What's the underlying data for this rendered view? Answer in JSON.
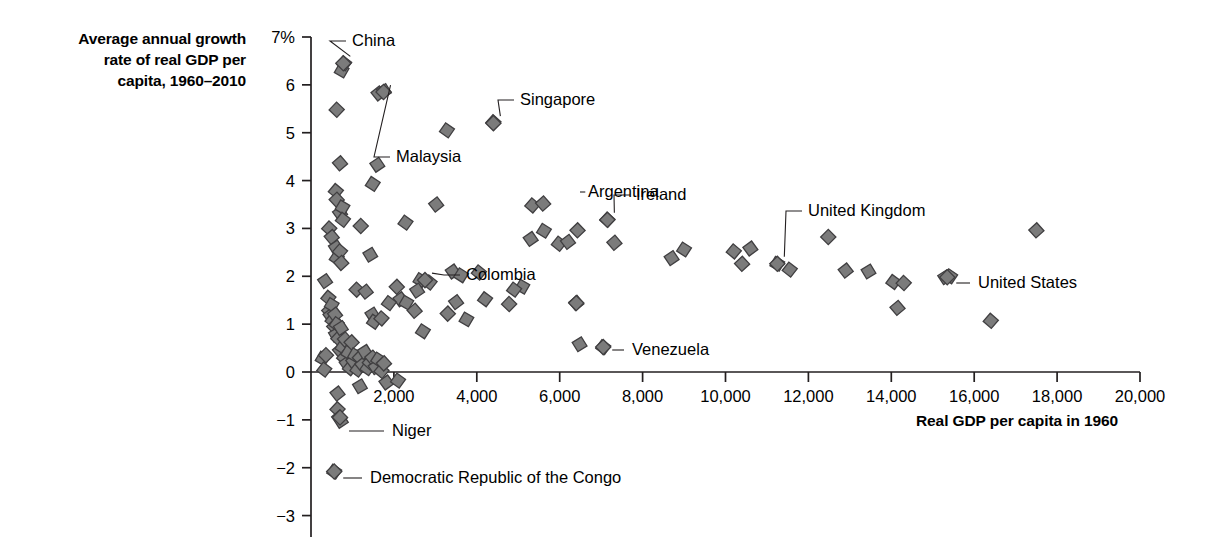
{
  "axis_title_y": "Average annual growth rate of real GDP per capita, 1960–2010",
  "axis_title_y_lines": [
    "Average annual growth",
    "rate of real GDP per",
    "capita, 1960–2010"
  ],
  "axis_title_x": "Real GDP per capita in 1960",
  "colors": {
    "marker_fill": "#7b7b7b",
    "marker_stroke": "#403f41",
    "axis": "#231f20",
    "text": "#000000"
  },
  "chart_data": {
    "type": "scatter",
    "title": "",
    "xlabel": "Real GDP per capita in 1960",
    "ylabel": "Average annual growth rate of real GDP per capita, 1960–2010",
    "xlim": [
      0,
      20000
    ],
    "ylim": [
      -3,
      7
    ],
    "grid": false,
    "legend": "none",
    "xticks": [
      2000,
      4000,
      6000,
      8000,
      10000,
      12000,
      14000,
      16000,
      18000,
      20000
    ],
    "xtick_labels": [
      "2,000",
      "4,000",
      "6,000",
      "8,000",
      "10,000",
      "12,000",
      "14,000",
      "16,000",
      "18,000",
      "20,000"
    ],
    "yticks": [
      7,
      6,
      5,
      4,
      3,
      2,
      1,
      0,
      -1,
      -2,
      -3
    ],
    "ytick_labels": [
      "7%",
      "6",
      "5",
      "4",
      "3",
      "2",
      "1",
      "0",
      "−1",
      "−2",
      "−3"
    ],
    "annotations": [
      {
        "label": "China",
        "x": 780,
        "y": 6.45
      },
      {
        "label": "Singapore",
        "x": 4400,
        "y": 5.2
      },
      {
        "label": "Malaysia",
        "x": 1750,
        "y": 5.85
      },
      {
        "label": "Ireland",
        "x": 7150,
        "y": 3.18
      },
      {
        "label": "United Kingdom",
        "x": 11250,
        "y": 2.26
      },
      {
        "label": "United States",
        "x": 15350,
        "y": 1.98
      },
      {
        "label": "Colombia",
        "x": 2750,
        "y": 1.92
      },
      {
        "label": "Argentina",
        "x": 6400,
        "y": 1.44
      },
      {
        "label": "Venezuela",
        "x": 7050,
        "y": 0.52
      },
      {
        "label": "Niger",
        "x": 700,
        "y": -0.95
      },
      {
        "label": "Democratic Republic of the Congo",
        "x": 560,
        "y": -2.08
      }
    ],
    "points": [
      [
        740,
        6.3
      ],
      [
        800,
        6.45
      ],
      [
        620,
        5.48
      ],
      [
        1630,
        5.82
      ],
      [
        1760,
        5.87
      ],
      [
        3280,
        5.05
      ],
      [
        4400,
        5.22
      ],
      [
        700,
        4.36
      ],
      [
        1600,
        4.33
      ],
      [
        1490,
        3.93
      ],
      [
        600,
        3.78
      ],
      [
        620,
        3.6
      ],
      [
        700,
        3.32
      ],
      [
        760,
        3.44
      ],
      [
        770,
        3.18
      ],
      [
        1200,
        3.05
      ],
      [
        3020,
        3.5
      ],
      [
        1430,
        2.45
      ],
      [
        2280,
        3.12
      ],
      [
        440,
        3.0
      ],
      [
        500,
        2.82
      ],
      [
        600,
        2.6
      ],
      [
        620,
        2.38
      ],
      [
        700,
        2.52
      ],
      [
        730,
        2.28
      ],
      [
        340,
        1.9
      ],
      [
        2640,
        1.92
      ],
      [
        2860,
        1.87
      ],
      [
        2070,
        1.78
      ],
      [
        2160,
        1.52
      ],
      [
        2300,
        1.45
      ],
      [
        1880,
        1.44
      ],
      [
        1100,
        1.72
      ],
      [
        1320,
        1.68
      ],
      [
        1480,
        1.2
      ],
      [
        1520,
        1.05
      ],
      [
        1700,
        1.12
      ],
      [
        2500,
        1.28
      ],
      [
        2560,
        1.7
      ],
      [
        2700,
        0.85
      ],
      [
        420,
        1.55
      ],
      [
        440,
        1.28
      ],
      [
        470,
        1.18
      ],
      [
        500,
        1.4
      ],
      [
        520,
        1.08
      ],
      [
        560,
        0.95
      ],
      [
        580,
        1.2
      ],
      [
        600,
        0.78
      ],
      [
        620,
        1.0
      ],
      [
        660,
        0.7
      ],
      [
        700,
        0.45
      ],
      [
        720,
        0.92
      ],
      [
        760,
        0.52
      ],
      [
        800,
        0.3
      ],
      [
        820,
        0.68
      ],
      [
        860,
        0.18
      ],
      [
        900,
        0.4
      ],
      [
        940,
        0.08
      ],
      [
        980,
        0.62
      ],
      [
        1020,
        0.22
      ],
      [
        1060,
        0.35
      ],
      [
        1120,
        0.05
      ],
      [
        1180,
        0.3
      ],
      [
        1240,
        0.15
      ],
      [
        1300,
        0.42
      ],
      [
        1360,
        0.08
      ],
      [
        1420,
        0.2
      ],
      [
        1480,
        0.3
      ],
      [
        1560,
        0.1
      ],
      [
        1620,
        0.26
      ],
      [
        1700,
        0.02
      ],
      [
        1760,
        0.18
      ],
      [
        1820,
        -0.22
      ],
      [
        280,
        0.28
      ],
      [
        320,
        0.05
      ],
      [
        360,
        0.35
      ],
      [
        640,
        -0.45
      ],
      [
        1180,
        -0.3
      ],
      [
        2100,
        -0.18
      ],
      [
        640,
        -0.78
      ],
      [
        680,
        -0.95
      ],
      [
        720,
        -1.02
      ],
      [
        560,
        -2.08
      ],
      [
        5340,
        3.48
      ],
      [
        5600,
        3.52
      ],
      [
        5300,
        2.78
      ],
      [
        5620,
        2.95
      ],
      [
        5980,
        2.68
      ],
      [
        6430,
        2.96
      ],
      [
        6200,
        2.72
      ],
      [
        5100,
        1.78
      ],
      [
        4900,
        1.72
      ],
      [
        4780,
        1.42
      ],
      [
        6400,
        1.44
      ],
      [
        6480,
        0.58
      ],
      [
        7050,
        0.52
      ],
      [
        7150,
        3.18
      ],
      [
        7320,
        2.7
      ],
      [
        8700,
        2.38
      ],
      [
        9000,
        2.56
      ],
      [
        10200,
        2.52
      ],
      [
        10400,
        2.26
      ],
      [
        10600,
        2.58
      ],
      [
        11250,
        2.26
      ],
      [
        11550,
        2.14
      ],
      [
        12480,
        2.82
      ],
      [
        12900,
        2.12
      ],
      [
        13450,
        2.1
      ],
      [
        14050,
        1.88
      ],
      [
        14300,
        1.86
      ],
      [
        14150,
        1.34
      ],
      [
        15300,
        1.98
      ],
      [
        15420,
        2.0
      ],
      [
        16400,
        1.07
      ],
      [
        17500,
        2.96
      ],
      [
        3420,
        2.1
      ],
      [
        3620,
        2.02
      ],
      [
        4050,
        2.08
      ],
      [
        3300,
        1.22
      ],
      [
        3500,
        1.46
      ],
      [
        3750,
        1.1
      ],
      [
        4200,
        1.52
      ]
    ]
  }
}
